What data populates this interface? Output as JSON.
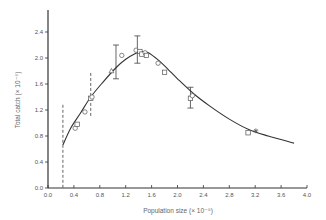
{
  "chart_data": {
    "type": "scatter",
    "title": "",
    "xlabel": "Population size (× 10⁻⁵)",
    "ylabel": "Total catch (× 10⁻⁵)",
    "xlim": [
      0.0,
      4.0
    ],
    "ylim": [
      0.0,
      2.6
    ],
    "grid": false,
    "legend": null,
    "x_ticks": [
      "0.0",
      "0.4",
      "0.8",
      "1.2",
      "1.6",
      "2.0",
      "2.4",
      "2.8",
      "3.2",
      "3.6",
      "4.0"
    ],
    "y_ticks": [
      "0.0",
      "0.4",
      "0.8",
      "1.2",
      "1.6",
      "2.0",
      "2.4"
    ],
    "fitted_curve": {
      "name": "Fitted yield curve",
      "x": [
        0.23,
        0.35,
        0.5,
        0.66,
        0.85,
        1.05,
        1.2,
        1.35,
        1.45,
        1.55,
        1.7,
        1.85,
        2.0,
        2.25,
        2.5,
        2.8,
        3.1,
        3.4,
        3.8
      ],
      "y": [
        0.66,
        0.92,
        1.15,
        1.4,
        1.63,
        1.85,
        1.98,
        2.07,
        2.1,
        2.08,
        1.97,
        1.83,
        1.68,
        1.45,
        1.26,
        1.06,
        0.9,
        0.8,
        0.69
      ]
    },
    "observations": {
      "x": [
        0.42,
        0.45,
        0.57,
        0.66,
        0.68,
        0.98,
        1.14,
        1.36,
        1.42,
        1.45,
        1.5,
        1.52,
        1.7,
        1.8,
        2.2,
        2.23,
        3.09,
        3.21
      ],
      "y": [
        0.92,
        0.98,
        1.17,
        1.38,
        1.4,
        1.8,
        2.04,
        2.12,
        2.1,
        2.06,
        2.08,
        2.04,
        1.92,
        1.78,
        1.38,
        1.42,
        0.85,
        0.88
      ],
      "markers": [
        "circle",
        "square",
        "circle",
        "square",
        "circle",
        "triangle",
        "circle",
        "circle",
        "square",
        "square",
        "circle",
        "square",
        "circle",
        "square",
        "square",
        "circle",
        "square",
        "star"
      ]
    },
    "error_bars": [
      {
        "x": 0.23,
        "low": 0.0,
        "high": 1.28,
        "style": "dashed"
      },
      {
        "x": 0.66,
        "low": 1.1,
        "high": 1.77,
        "style": "dashed"
      },
      {
        "x": 1.05,
        "low": 1.68,
        "high": 2.2,
        "style": "solid"
      },
      {
        "x": 1.38,
        "low": 1.92,
        "high": 2.34,
        "style": "solid"
      },
      {
        "x": 2.2,
        "low": 1.23,
        "high": 1.55,
        "style": "solid"
      }
    ]
  },
  "layout": {
    "origin_px": [
      48,
      188
    ],
    "x_px_per_unit": 64.75,
    "y_px_per_unit": 65,
    "axis_color": "#333333",
    "curve_color": "#333333",
    "marker_color": "#555555"
  }
}
